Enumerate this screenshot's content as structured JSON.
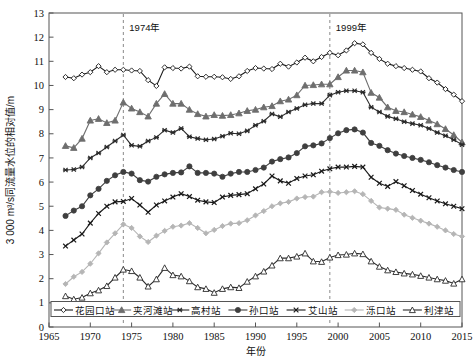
{
  "chart_data": {
    "type": "line",
    "title": "",
    "xlabel": "年份",
    "ylabel": "3 000 m³/s同流量水位的相对值/m",
    "xlim": [
      1965,
      2015
    ],
    "ylim": [
      0,
      13
    ],
    "xticks": [
      1965,
      1970,
      1975,
      1980,
      1985,
      1990,
      1995,
      2000,
      2005,
      2010,
      2015
    ],
    "yticks": [
      0,
      1,
      2,
      3,
      4,
      5,
      6,
      7,
      8,
      9,
      10,
      11,
      12,
      13
    ],
    "grid": false,
    "legend_position": "bottom-inside",
    "annotations": [
      {
        "label": "1974年",
        "x": 1974,
        "type": "vertical-dashed-line"
      },
      {
        "label": "1999年",
        "x": 1999,
        "type": "vertical-dashed-line"
      }
    ],
    "x": [
      1967,
      1968,
      1969,
      1970,
      1971,
      1972,
      1973,
      1974,
      1975,
      1976,
      1977,
      1978,
      1979,
      1980,
      1981,
      1982,
      1983,
      1984,
      1985,
      1986,
      1987,
      1988,
      1989,
      1990,
      1991,
      1992,
      1993,
      1994,
      1995,
      1996,
      1997,
      1998,
      1999,
      2000,
      2001,
      2002,
      2003,
      2004,
      2005,
      2006,
      2007,
      2008,
      2009,
      2010,
      2011,
      2012,
      2013,
      2014,
      2015
    ],
    "series": [
      {
        "name": "花园口站",
        "color": "#1a1a1a",
        "marker": "open-diamond",
        "values": [
          10.35,
          10.3,
          10.45,
          10.55,
          10.8,
          10.55,
          10.65,
          10.65,
          10.62,
          10.6,
          10.22,
          9.98,
          10.75,
          10.72,
          10.7,
          10.78,
          10.38,
          10.36,
          10.36,
          10.34,
          10.27,
          10.38,
          10.6,
          10.72,
          10.7,
          10.68,
          10.9,
          10.78,
          10.95,
          11.15,
          11.0,
          11.18,
          11.35,
          11.25,
          11.45,
          11.75,
          11.7,
          11.35,
          11.1,
          10.9,
          10.8,
          10.72,
          10.65,
          10.58,
          10.3,
          10.12,
          9.85,
          9.62,
          9.35
        ]
      },
      {
        "name": "夹河滩站",
        "color": "#6e6e6e",
        "marker": "filled-triangle",
        "values": [
          7.5,
          7.42,
          7.8,
          8.55,
          8.62,
          8.45,
          8.55,
          9.3,
          9.05,
          8.9,
          8.72,
          9.25,
          9.65,
          9.25,
          9.25,
          9.0,
          8.82,
          8.72,
          8.78,
          8.75,
          8.78,
          8.85,
          8.95,
          9.0,
          9.1,
          9.15,
          9.35,
          9.42,
          9.6,
          10.0,
          10.02,
          10.05,
          10.05,
          10.35,
          10.62,
          10.62,
          10.55,
          9.7,
          9.5,
          9.1,
          8.95,
          8.9,
          8.8,
          8.7,
          8.55,
          8.4,
          8.2,
          7.95,
          7.65
        ]
      },
      {
        "name": "高村站",
        "color": "#2b2b2b",
        "marker": "star",
        "values": [
          6.5,
          6.52,
          6.62,
          7.0,
          7.2,
          7.45,
          7.7,
          7.95,
          7.52,
          7.48,
          7.7,
          7.85,
          8.15,
          8.05,
          8.22,
          7.88,
          7.8,
          7.75,
          7.78,
          7.9,
          8.02,
          8.0,
          8.12,
          8.35,
          8.52,
          8.82,
          8.7,
          8.9,
          9.05,
          9.2,
          9.25,
          9.25,
          9.6,
          9.72,
          9.78,
          9.78,
          9.72,
          9.1,
          8.9,
          8.72,
          8.62,
          8.5,
          8.42,
          8.35,
          8.22,
          8.05,
          7.92,
          7.75,
          7.55
        ]
      },
      {
        "name": "孙口站",
        "color": "#3f3f3f",
        "marker": "filled-circle",
        "values": [
          4.6,
          4.82,
          5.0,
          5.45,
          5.72,
          6.05,
          6.28,
          6.42,
          6.35,
          6.08,
          6.02,
          6.22,
          6.32,
          6.38,
          6.4,
          6.65,
          6.38,
          6.38,
          6.35,
          6.22,
          6.35,
          6.42,
          6.42,
          6.5,
          6.6,
          6.85,
          6.95,
          7.02,
          7.2,
          7.48,
          7.52,
          7.6,
          7.82,
          8.02,
          8.15,
          8.18,
          8.05,
          7.62,
          7.5,
          7.32,
          7.18,
          7.08,
          7.0,
          6.92,
          6.82,
          6.7,
          6.6,
          6.5,
          6.42
        ]
      },
      {
        "name": "艾山站",
        "color": "#1a1a1a",
        "marker": "cross",
        "values": [
          3.35,
          3.6,
          3.85,
          4.3,
          4.7,
          5.0,
          5.18,
          5.2,
          5.32,
          5.05,
          4.75,
          5.05,
          5.22,
          5.38,
          5.52,
          5.4,
          5.25,
          5.18,
          5.15,
          5.38,
          5.45,
          5.48,
          5.52,
          5.72,
          5.92,
          6.25,
          6.05,
          5.95,
          6.15,
          6.25,
          6.3,
          6.45,
          6.55,
          6.62,
          6.62,
          6.65,
          6.62,
          6.2,
          5.95,
          5.82,
          6.02,
          5.85,
          5.65,
          5.5,
          5.35,
          5.22,
          5.1,
          5.0,
          4.9
        ]
      },
      {
        "name": "泺口站",
        "color": "#b5b5b5",
        "marker": "filled-diamond",
        "values": [
          1.78,
          2.08,
          2.28,
          2.62,
          3.05,
          3.5,
          3.88,
          4.25,
          4.1,
          3.75,
          3.52,
          3.78,
          3.98,
          4.15,
          4.2,
          4.3,
          4.1,
          3.88,
          4.02,
          4.18,
          4.28,
          4.3,
          4.42,
          4.62,
          4.8,
          5.0,
          5.12,
          5.18,
          5.32,
          5.38,
          5.4,
          5.58,
          5.6,
          5.55,
          5.58,
          5.62,
          5.5,
          5.22,
          4.95,
          4.9,
          4.85,
          4.65,
          4.52,
          4.4,
          4.28,
          4.15,
          4.0,
          3.85,
          3.75
        ]
      },
      {
        "name": "利津站",
        "color": "#2b2b2b",
        "marker": "open-triangle",
        "values": [
          1.28,
          1.15,
          1.22,
          1.4,
          1.52,
          1.7,
          2.05,
          2.38,
          2.32,
          2.05,
          1.68,
          1.98,
          2.45,
          2.15,
          2.1,
          1.9,
          1.65,
          1.58,
          1.42,
          1.58,
          1.65,
          1.62,
          1.88,
          2.1,
          2.3,
          2.55,
          2.85,
          2.85,
          2.92,
          3.05,
          2.72,
          2.7,
          2.88,
          2.98,
          3.0,
          3.05,
          3.02,
          2.72,
          2.5,
          2.35,
          2.28,
          2.22,
          2.18,
          2.12,
          2.05,
          1.98,
          1.92,
          1.8,
          1.98
        ]
      }
    ]
  },
  "legend": {
    "items": [
      {
        "label": "花园口站"
      },
      {
        "label": "夹河滩站"
      },
      {
        "label": "高村站"
      },
      {
        "label": "孙口站"
      },
      {
        "label": "艾山站"
      },
      {
        "label": "泺口站"
      },
      {
        "label": "利津站"
      }
    ]
  }
}
